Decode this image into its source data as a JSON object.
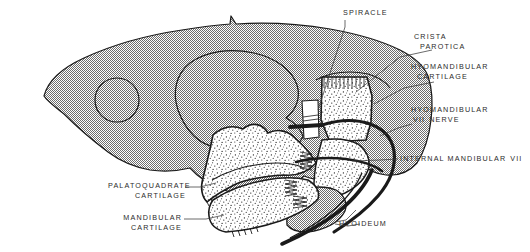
{
  "figure": {
    "background_color": "#ffffff",
    "ink_color": "#1a1a1a",
    "cranium_fill": "#a8a8a8",
    "cartilage_fill": "#ffffff",
    "label_color": "#2b2b2b"
  },
  "labels": {
    "spiracle": {
      "text": "SPIRACLE"
    },
    "crista_parotica": {
      "line1": "CRISTA",
      "line2": "PAROTICA"
    },
    "hyomandibular_cartilage": {
      "line1": "HYOMANDIBULAR",
      "line2": "CARTILAGE"
    },
    "hyomandibular_nerve": {
      "line1": "HYOMANDIBULAR",
      "roman": "VII",
      "line2": "NERVE"
    },
    "internal_mandibular": {
      "text": "INTERNAL MANDIBULAR",
      "roman": "VII"
    },
    "palatoquadrate_cartilage": {
      "line1": "PALATOQUADRATE",
      "line2": "CARTILAGE"
    },
    "mandibular_cartilage": {
      "line1": "MANDIBULAR",
      "line2": "CARTILAGE"
    },
    "hyoideum": {
      "text": "HYOIDEUM"
    }
  },
  "structures": [
    {
      "name": "cranium",
      "fill": "#a8a8a8",
      "description": "large stippled braincase occupying upper left two thirds"
    },
    {
      "name": "orbit",
      "description": "small circular opening in anterior cranium"
    },
    {
      "name": "otic-capsule",
      "description": "large rounded outline in mid cranium"
    },
    {
      "name": "hyomandibular-cartilage",
      "fill": "#ffffff",
      "description": "vertical speckled bar below crista parotica"
    },
    {
      "name": "palatoquadrate-cartilage",
      "fill": "#ffffff",
      "description": "upper jaw speckled element"
    },
    {
      "name": "mandibular-cartilage",
      "fill": "#ffffff",
      "description": "lower jaw speckled element"
    },
    {
      "name": "hyoideum",
      "fill": "#a8a8a8",
      "description": "ceratohyal element below jaw joint"
    },
    {
      "name": "facial-nerve-VII",
      "description": "thick black curved nerve trunk"
    },
    {
      "name": "spiracular-tube",
      "fill": "#ffffff",
      "description": "white vertical tube crossing nerve"
    }
  ]
}
